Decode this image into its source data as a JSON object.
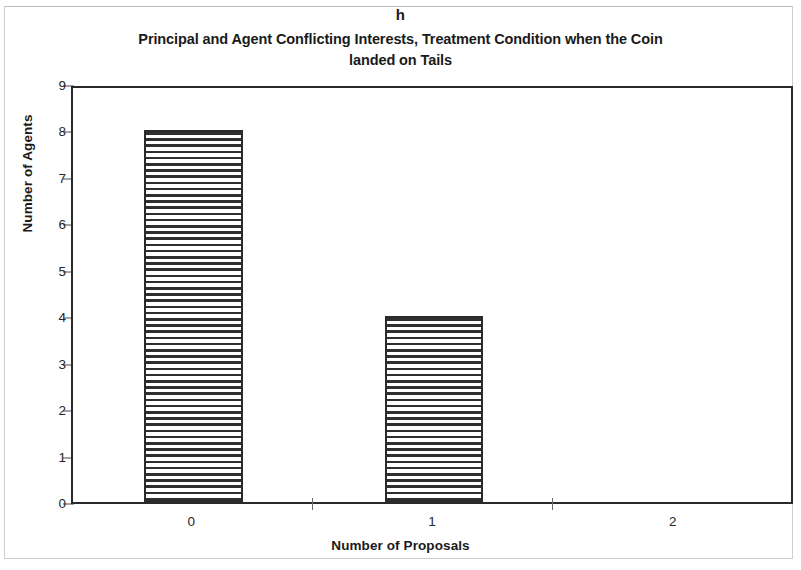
{
  "panel": {
    "letter": "h"
  },
  "chart_data": {
    "type": "bar",
    "title": "Principal and Agent Conflicting Interests, Treatment Condition when the Coin landed on Tails",
    "title_line1": "Principal and Agent Conflicting Interests, Treatment Condition when the Coin",
    "title_line2": "landed on Tails",
    "xlabel": "Number of Proposals",
    "ylabel": "Number of Agents",
    "categories": [
      "0",
      "1",
      "2"
    ],
    "values": [
      8,
      4,
      0
    ],
    "ylim": [
      0,
      9
    ],
    "yticks": [
      0,
      1,
      2,
      3,
      4,
      5,
      6,
      7,
      8,
      9
    ],
    "ytick_labels": [
      "0",
      "1",
      "2",
      "3",
      "4",
      "5",
      "6",
      "7",
      "8",
      "9"
    ],
    "grid": false,
    "legend": null,
    "bar_fill": "horizontal-hatch",
    "bar_edge_color": "#2b2b2b",
    "background_color": "#ffffff"
  }
}
